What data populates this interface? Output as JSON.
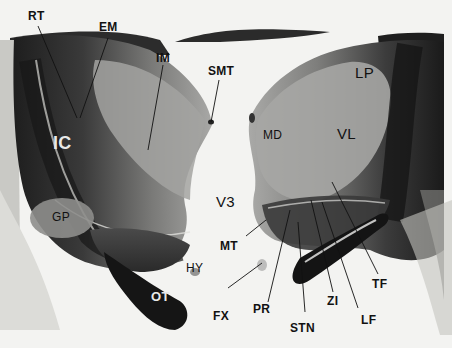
{
  "figure": {
    "background_color": "#f3f3f1",
    "tissue_dark": "#2a2a2a",
    "tissue_mid": "#6e6e6e",
    "tissue_light": "#a9a9a7"
  },
  "labels": {
    "rt": "RT",
    "em": "EM",
    "im": "IM",
    "smt": "SMT",
    "lp": "LP",
    "ic": "IC",
    "md": "MD",
    "vl": "VL",
    "v3": "V3",
    "gp": "GP",
    "mt": "MT",
    "hy": "HY",
    "ot": "OT",
    "fx": "FX",
    "pr": "PR",
    "zi": "ZI",
    "tf": "TF",
    "stn": "STN",
    "lf": "LF"
  }
}
